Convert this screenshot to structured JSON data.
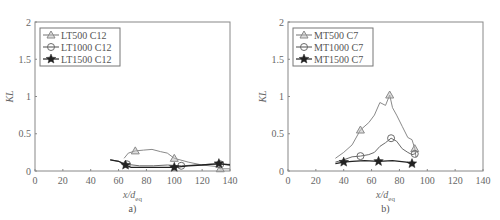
{
  "chart_data": [
    {
      "type": "line",
      "panel_label": "a)",
      "xlabel": "x/d_eq",
      "xlabel_main": "x/d",
      "xlabel_sub": "eq",
      "ylabel": "KL",
      "xlim": [
        0,
        140
      ],
      "ylim": [
        0,
        2
      ],
      "xticks": [
        "0",
        "20",
        "40",
        "60",
        "80",
        "100",
        "120",
        "140"
      ],
      "yticks": [
        "0",
        "0.5",
        "1",
        "1.5",
        "2"
      ],
      "grid": false,
      "legend_position": "upper left",
      "series": [
        {
          "name": "LT500 C12",
          "marker": "triangle",
          "color": "#8a8a8a",
          "x": [
            64,
            67,
            72,
            78,
            84,
            90,
            95,
            100,
            110,
            120,
            130,
            133,
            140
          ],
          "y": [
            0.17,
            0.24,
            0.27,
            0.28,
            0.29,
            0.26,
            0.24,
            0.17,
            0.12,
            0.08,
            0.06,
            0.03,
            0.03
          ]
        },
        {
          "name": "LT1000 C12",
          "marker": "circle",
          "color": "#6a6a6a",
          "x": [
            54,
            60,
            66,
            75,
            85,
            95,
            105,
            115,
            126,
            133,
            140
          ],
          "y": [
            0.15,
            0.13,
            0.09,
            0.07,
            0.07,
            0.08,
            0.07,
            0.08,
            0.09,
            0.09,
            0.09
          ]
        },
        {
          "name": "LT1500 C12",
          "marker": "star",
          "color": "#222222",
          "x": [
            54,
            60,
            65,
            69,
            80,
            90,
            100,
            110,
            120,
            132,
            140
          ],
          "y": [
            0.15,
            0.13,
            0.08,
            0.05,
            0.05,
            0.05,
            0.05,
            0.07,
            0.08,
            0.1,
            0.08
          ]
        }
      ]
    },
    {
      "type": "line",
      "panel_label": "b)",
      "xlabel": "x/d_eq",
      "xlabel_main": "x/d",
      "xlabel_sub": "eq",
      "ylabel": "KL",
      "xlim": [
        0,
        140
      ],
      "ylim": [
        0,
        2
      ],
      "xticks": [
        "0",
        "20",
        "40",
        "60",
        "80",
        "100",
        "120",
        "140"
      ],
      "yticks": [
        "0",
        "0.5",
        "1",
        "1.5",
        "2"
      ],
      "grid": false,
      "legend_position": "upper left",
      "series": [
        {
          "name": "MT500 C7",
          "marker": "triangle",
          "color": "#8a8a8a",
          "x": [
            34,
            40,
            46,
            52,
            58,
            62,
            66,
            70,
            73,
            75,
            78,
            82,
            86,
            89,
            91,
            92
          ],
          "y": [
            0.17,
            0.25,
            0.35,
            0.55,
            0.65,
            0.75,
            0.92,
            0.88,
            1.02,
            0.85,
            0.75,
            0.6,
            0.45,
            0.42,
            0.3,
            0.18
          ]
        },
        {
          "name": "MT1000 C7",
          "marker": "circle",
          "color": "#6a6a6a",
          "x": [
            34,
            40,
            46,
            52,
            58,
            62,
            66,
            70,
            74,
            78,
            82,
            86,
            89,
            91,
            92
          ],
          "y": [
            0.12,
            0.15,
            0.19,
            0.2,
            0.22,
            0.25,
            0.33,
            0.38,
            0.44,
            0.4,
            0.3,
            0.25,
            0.22,
            0.23,
            0.25
          ]
        },
        {
          "name": "MT1500 C7",
          "marker": "star",
          "color": "#222222",
          "x": [
            34,
            40,
            46,
            55,
            65,
            75,
            85,
            89,
            91
          ],
          "y": [
            0.1,
            0.12,
            0.13,
            0.14,
            0.13,
            0.14,
            0.12,
            0.1,
            0.1
          ]
        }
      ]
    }
  ]
}
